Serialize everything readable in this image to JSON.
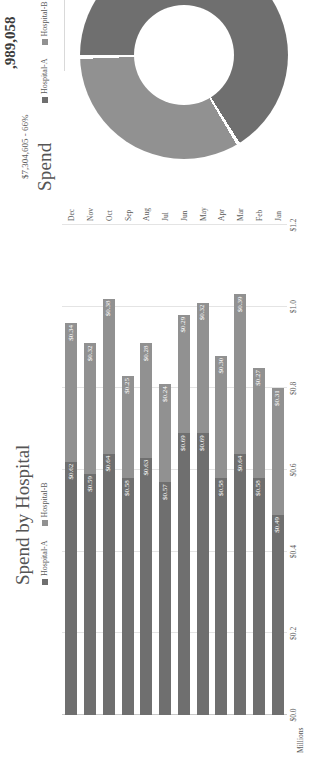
{
  "kpi": {
    "value": ",989,058"
  },
  "donut": {
    "title": "Spend",
    "legend": [
      {
        "label": "Hospital-A",
        "color": "#6f6f6f"
      },
      {
        "label": "Hospital-B",
        "color": "#919191"
      }
    ],
    "callout": "$7,304,605 - 66%"
  },
  "bar": {
    "title": "Spend by Hospital",
    "legend": [
      {
        "label": "Hospital-A",
        "color": "#6f6f6f"
      },
      {
        "label": "Hospital-B",
        "color": "#919191"
      }
    ],
    "axis_unit": "Millions"
  },
  "chart_data": [
    {
      "type": "bar",
      "title": "Spend by Hospital",
      "orientation": "vertical-stacked",
      "stacked": true,
      "xlabel": "",
      "ylabel": "Millions",
      "ylim": [
        0,
        1.2
      ],
      "yticks": [
        "$0.0",
        "$0.2",
        "$0.4",
        "$0.6",
        "$0.8",
        "$1.0",
        "$1.2"
      ],
      "ytick_values": [
        0.0,
        0.2,
        0.4,
        0.6,
        0.8,
        1.0,
        1.2
      ],
      "grid": true,
      "legend_position": "top",
      "categories": [
        "Jan",
        "Feb",
        "Mar",
        "Apr",
        "May",
        "Jun",
        "Jul",
        "Aug",
        "Sep",
        "Oct",
        "Nov",
        "Dec"
      ],
      "series": [
        {
          "name": "Hospital-A",
          "color": "#6f6f6f",
          "values": [
            0.49,
            0.58,
            0.64,
            0.58,
            0.69,
            0.69,
            0.57,
            0.63,
            0.58,
            0.64,
            0.59,
            0.62
          ],
          "labels": [
            "$0.49",
            "$0.58",
            "$0.64",
            "$0.58",
            "$0.69",
            "$0.69",
            "$0.57",
            "$0.63",
            "$0.58",
            "$0.64",
            "$0.59",
            "$0.62"
          ]
        },
        {
          "name": "Hospital-B",
          "color": "#919191",
          "values": [
            0.31,
            0.27,
            0.39,
            0.3,
            0.32,
            0.29,
            0.24,
            0.28,
            0.25,
            0.38,
            0.32,
            0.34
          ],
          "labels": [
            "$0.31",
            "$0.27",
            "$0.39",
            "$0.30",
            "$0.32",
            "$0.29",
            "$0.24",
            "$0.28",
            "$0.25",
            "$0.38",
            "$0.32",
            "$0.34"
          ]
        }
      ]
    },
    {
      "type": "pie",
      "variant": "donut",
      "title": "Spend",
      "legend_position": "top",
      "labels": [
        "Hospital-A",
        "Hospital-B"
      ],
      "values": [
        66,
        34
      ],
      "colors": [
        "#6f6f6f",
        "#919191"
      ],
      "annotations": [
        "$7,304,605 - 66%"
      ]
    }
  ]
}
